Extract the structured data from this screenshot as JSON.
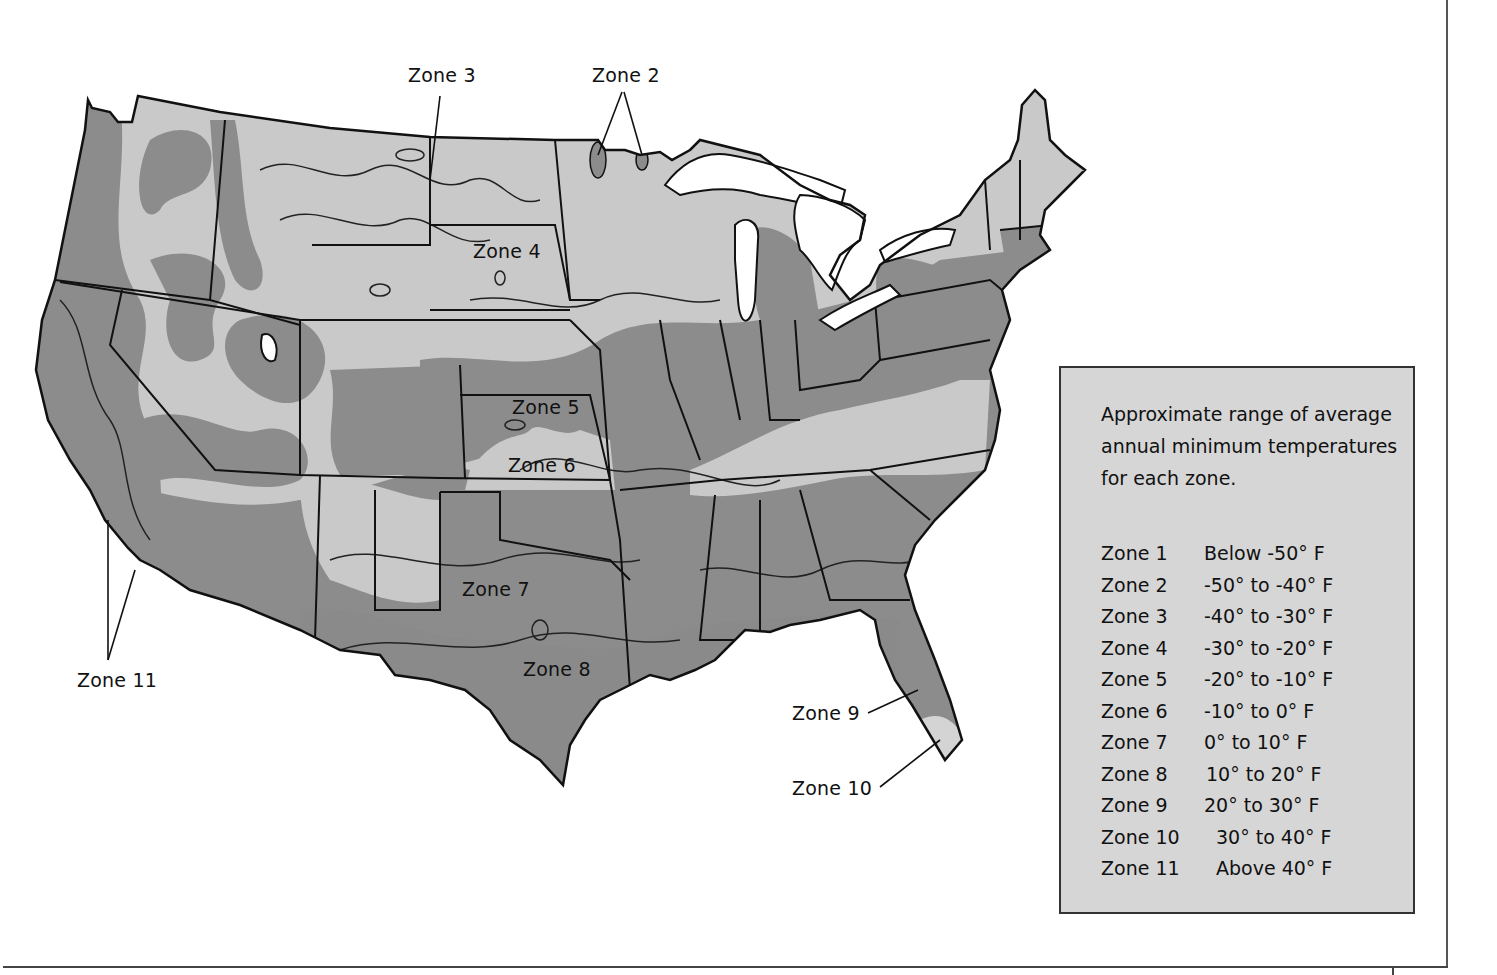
{
  "map": {
    "colors": {
      "zone_light": "#c9c9c9",
      "zone_dark": "#8c8c8c",
      "zone_lighter": "#d4d4d4",
      "water": "#ffffff",
      "border": "#111111",
      "legend_bg": "#d6d6d6"
    },
    "labels": {
      "zone3": "Zone 3",
      "zone2": "Zone 2",
      "zone4": "Zone 4",
      "zone5": "Zone 5",
      "zone6": "Zone 6",
      "zone7": "Zone 7",
      "zone8": "Zone 8",
      "zone9": "Zone 9",
      "zone10": "Zone 10",
      "zone11": "Zone 11"
    }
  },
  "legend": {
    "title": "Approximate range of average annual minimum temperatures for each zone.",
    "rows": [
      {
        "zone": "Zone 1",
        "range": "Below -50° F"
      },
      {
        "zone": "Zone 2",
        "range": "-50° to -40° F"
      },
      {
        "zone": "Zone 3",
        "range": "-40° to -30° F"
      },
      {
        "zone": "Zone 4",
        "range": "-30° to -20° F"
      },
      {
        "zone": "Zone 5",
        "range": "-20° to -10° F"
      },
      {
        "zone": "Zone 6",
        "range": "-10° to 0° F"
      },
      {
        "zone": "Zone 7",
        "range": "0° to 10° F"
      },
      {
        "zone": "Zone 8",
        "range": "10° to 20° F"
      },
      {
        "zone": "Zone 9",
        "range": "20° to 30° F"
      },
      {
        "zone": "Zone 10",
        "range": "30° to 40° F"
      },
      {
        "zone": "Zone 11",
        "range": "Above 40° F"
      }
    ]
  }
}
